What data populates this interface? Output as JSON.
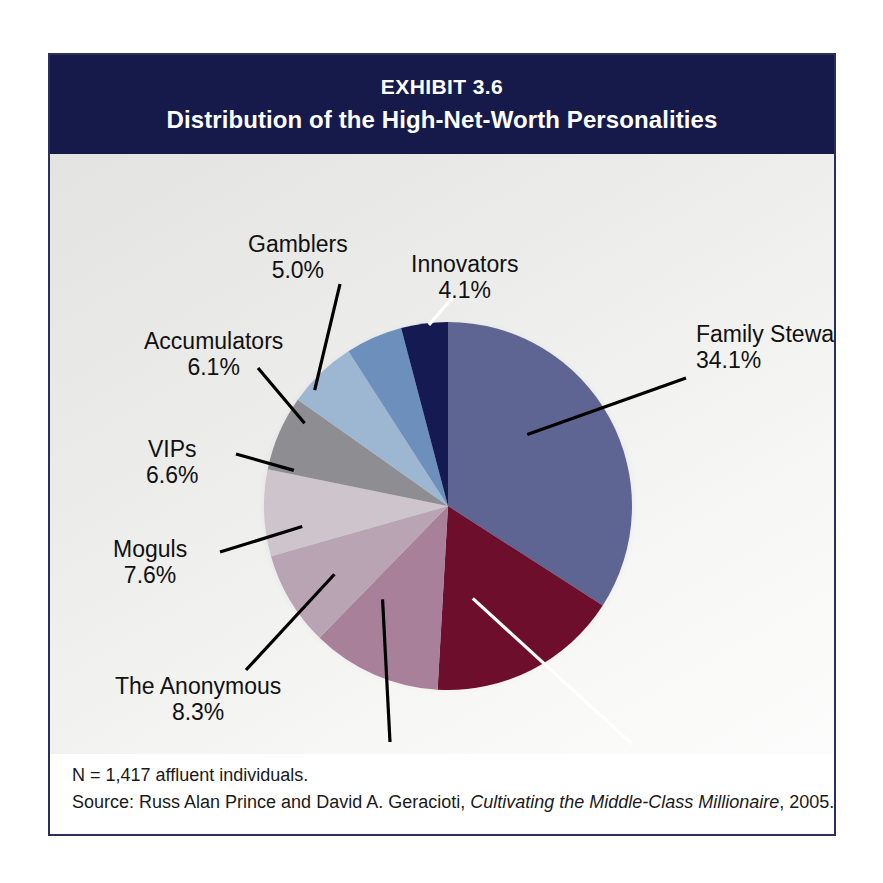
{
  "header": {
    "exhibit_number": "EXHIBIT 3.6",
    "title": "Distribution of the High-Net-Worth Personalities",
    "background_color": "#151a4a",
    "text_color": "#ffffff"
  },
  "footnote": {
    "line1": "N = 1,417 affluent individuals.",
    "source_prefix": "Source: Russ Alan Prince and David A. Geracioti, ",
    "source_italic": "Cultivating the Middle-Class Millionaire",
    "source_suffix": ", 2005."
  },
  "chart_data": {
    "type": "pie",
    "title": "Distribution of the High-Net-Worth Personalities",
    "subtitle": "EXHIBIT 3.6",
    "units": "percent",
    "total": 100.0,
    "sample_size": 1417,
    "start_angle_deg": 0,
    "direction": "clockwise",
    "legend": "none",
    "labels_position": "callout-leader-lines",
    "categories": [
      "Family Stewards",
      "Independents",
      "Phobics",
      "The Anonymous",
      "Moguls",
      "VIPs",
      "Accumulators",
      "Gamblers",
      "Innovators"
    ],
    "values": [
      34.1,
      16.8,
      11.4,
      8.3,
      7.6,
      6.6,
      6.1,
      5.0,
      4.1
    ],
    "value_labels": [
      "34.1%",
      "16.8%",
      "11.4%",
      "8.3%",
      "7.6%",
      "6.6%",
      "6.1%",
      "5.0%",
      "4.1%"
    ],
    "colors": [
      "#5f6593",
      "#6d0f2c",
      "#a9809a",
      "#b8a4b2",
      "#cdc4cc",
      "#8d8d92",
      "#9db7d2",
      "#6d8fbb",
      "#161a52"
    ],
    "slices": [
      {
        "label": "Family Stewards",
        "value": 34.1,
        "value_label": "34.1%",
        "color": "#5f6593"
      },
      {
        "label": "Independents",
        "value": 16.8,
        "value_label": "16.8%",
        "color": "#6d0f2c"
      },
      {
        "label": "Phobics",
        "value": 11.4,
        "value_label": "11.4%",
        "color": "#a9809a"
      },
      {
        "label": "The Anonymous",
        "value": 8.3,
        "value_label": "8.3%",
        "color": "#b8a4b2"
      },
      {
        "label": "Moguls",
        "value": 7.6,
        "value_label": "7.6%",
        "color": "#cdc4cc"
      },
      {
        "label": "VIPs",
        "value": 6.6,
        "value_label": "6.6%",
        "color": "#8d8d92"
      },
      {
        "label": "Accumulators",
        "value": 6.1,
        "value_label": "6.1%",
        "color": "#9db7d2"
      },
      {
        "label": "Gamblers",
        "value": 5.0,
        "value_label": "5.0%",
        "color": "#6d8fbb"
      },
      {
        "label": "Innovators",
        "value": 4.1,
        "value_label": "4.1%",
        "color": "#161a52"
      }
    ]
  }
}
